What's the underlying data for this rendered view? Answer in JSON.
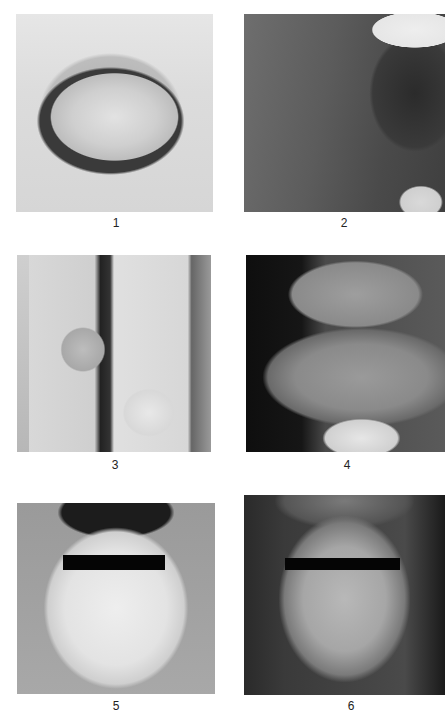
{
  "figure": {
    "panels": [
      {
        "label": "1",
        "subject": "tongue",
        "tone": "light"
      },
      {
        "label": "2",
        "subject": "buccal-mucosa-cheek",
        "tone": "dark"
      },
      {
        "label": "3",
        "subject": "fingernails",
        "tone": "light"
      },
      {
        "label": "4",
        "subject": "upper-lip",
        "tone": "dark"
      },
      {
        "label": "5",
        "subject": "face-eyes-censored",
        "tone": "light"
      },
      {
        "label": "6",
        "subject": "face-eyes-censored",
        "tone": "dark"
      }
    ],
    "background_color": "#ffffff",
    "censor_bar_color": "#050505"
  }
}
